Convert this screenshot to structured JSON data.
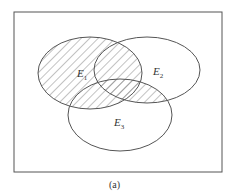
{
  "diagram": {
    "type": "venn",
    "caption": "(a)",
    "sets": [
      {
        "name": "E",
        "sub": "1"
      },
      {
        "name": "E",
        "sub": "2"
      },
      {
        "name": "E",
        "sub": "3"
      }
    ],
    "shaded_region": "E1 ∪ (E2 ∩ E3)",
    "colors": {
      "stroke": "#555555",
      "hatch": "#666666",
      "background": "#ffffff"
    }
  }
}
